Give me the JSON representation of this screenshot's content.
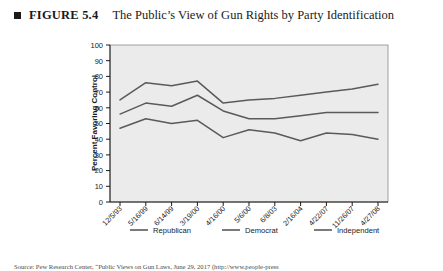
{
  "figure": {
    "bullet_icon": "square-bullet-icon",
    "label": "FIGURE 5.4",
    "title": "The Public’s View of Gun Rights by Party Identification"
  },
  "source_note": "Source: Pew Research Center, “Public Views on Gun Laws, June 29, 2017 (http://www.people-press",
  "legend": {
    "position": "bottom",
    "items": [
      {
        "label": "Republican",
        "color": "#5a5a5a"
      },
      {
        "label": "Democrat",
        "color": "#5a5a5a"
      },
      {
        "label": "Independent",
        "color": "#5a5a5a"
      }
    ]
  },
  "chart_data": {
    "type": "line",
    "title": "The Public’s View of Gun Rights by Party Identification",
    "xlabel": "",
    "ylabel": "Percent Favoring Control",
    "ylim": [
      0,
      100
    ],
    "ytick_step": 10,
    "yticks": [
      0,
      10,
      20,
      30,
      40,
      50,
      60,
      70,
      80,
      90,
      100
    ],
    "grid": false,
    "plot_background": "#ebebeb",
    "categories": [
      "12/5/93",
      "5/16/99",
      "6/14/99",
      "3/19/00",
      "4/16/00",
      "5/6/00",
      "6/8/03",
      "2/16/04",
      "4/22/07",
      "11/26/07",
      "4/27/08"
    ],
    "series": [
      {
        "name": "Democrat",
        "color": "#5a5a5a",
        "values": [
          65,
          76,
          74,
          77,
          63,
          65,
          66,
          68,
          70,
          72,
          75
        ]
      },
      {
        "name": "Independent",
        "color": "#5a5a5a",
        "values": [
          56,
          63,
          61,
          68,
          58,
          53,
          53,
          55,
          57,
          57,
          57
        ]
      },
      {
        "name": "Republican",
        "color": "#5a5a5a",
        "values": [
          47,
          53,
          50,
          52,
          41,
          46,
          44,
          39,
          44,
          43,
          40
        ]
      }
    ]
  }
}
